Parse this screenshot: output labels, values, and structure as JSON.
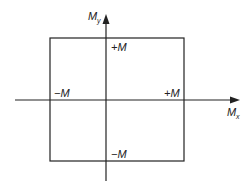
{
  "diagram": {
    "type": "interaction-diagram",
    "x_axis_label": "M",
    "x_axis_subscript": "x",
    "y_axis_label": "M",
    "y_axis_subscript": "y",
    "labels": {
      "top": "+M",
      "bottom": "−M",
      "left": "−M",
      "right": "+M"
    },
    "colors": {
      "line": "#222222",
      "background": "#ffffff"
    }
  }
}
